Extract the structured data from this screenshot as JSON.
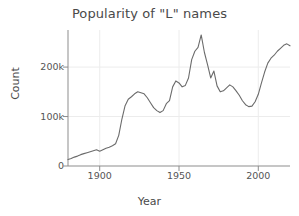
{
  "chart_data": {
    "type": "line",
    "title": "Popularity of \"L\" names",
    "xlabel": "Year",
    "ylabel": "Count",
    "xlim": [
      1880,
      2020
    ],
    "ylim": [
      0,
      275000
    ],
    "xticks": [
      1900,
      1950,
      2000
    ],
    "xtick_labels": [
      "1900",
      "1950",
      "2000"
    ],
    "yticks": [
      0,
      100000,
      200000
    ],
    "ytick_labels": [
      "0",
      "100k",
      "200k"
    ],
    "grid": true,
    "legend": null,
    "line_color": "#6b6b6b",
    "background_color": "#ffffff",
    "series": [
      {
        "name": "L names count",
        "x": [
          1880,
          1882,
          1884,
          1886,
          1888,
          1890,
          1892,
          1894,
          1896,
          1898,
          1900,
          1902,
          1904,
          1906,
          1908,
          1910,
          1912,
          1914,
          1916,
          1918,
          1920,
          1922,
          1924,
          1926,
          1928,
          1930,
          1932,
          1934,
          1936,
          1938,
          1940,
          1942,
          1944,
          1946,
          1948,
          1950,
          1952,
          1954,
          1956,
          1958,
          1960,
          1962,
          1964,
          1966,
          1968,
          1970,
          1972,
          1974,
          1976,
          1978,
          1980,
          1982,
          1984,
          1986,
          1988,
          1990,
          1992,
          1994,
          1996,
          1998,
          2000,
          2002,
          2004,
          2006,
          2008,
          2010,
          2012,
          2014,
          2016,
          2018,
          2020
        ],
        "values": [
          13000,
          15000,
          18000,
          20000,
          23000,
          25000,
          27000,
          29000,
          31000,
          33000,
          30000,
          33000,
          36000,
          38000,
          41000,
          45000,
          62000,
          95000,
          122000,
          135000,
          140000,
          146000,
          150000,
          148000,
          146000,
          138000,
          128000,
          118000,
          112000,
          108000,
          112000,
          126000,
          132000,
          160000,
          172000,
          168000,
          160000,
          163000,
          178000,
          215000,
          232000,
          240000,
          265000,
          230000,
          205000,
          178000,
          192000,
          162000,
          150000,
          152000,
          158000,
          164000,
          160000,
          152000,
          143000,
          132000,
          124000,
          120000,
          121000,
          130000,
          145000,
          168000,
          190000,
          208000,
          218000,
          224000,
          232000,
          238000,
          244000,
          247000,
          243000
        ]
      }
    ]
  }
}
